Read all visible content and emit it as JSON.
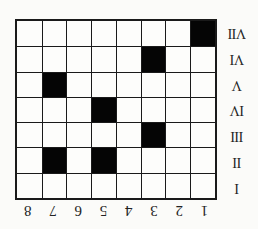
{
  "diagram": {
    "orientation": "rotated-180",
    "columns": [
      "1",
      "2",
      "3",
      "4",
      "5",
      "6",
      "7",
      "8"
    ],
    "rows": [
      "I",
      "II",
      "III",
      "IV",
      "V",
      "VI",
      "VII"
    ],
    "filled_cells": [
      {
        "row": "II",
        "col": "5"
      },
      {
        "row": "II",
        "col": "7"
      },
      {
        "row": "III",
        "col": "3"
      },
      {
        "row": "IV",
        "col": "5"
      },
      {
        "row": "V",
        "col": "7"
      },
      {
        "row": "VI",
        "col": "3"
      },
      {
        "row": "VII",
        "col": "1"
      }
    ],
    "colors": {
      "filled": "#050505",
      "empty": "#fdfdfb",
      "line": "#1a1a1a"
    }
  }
}
